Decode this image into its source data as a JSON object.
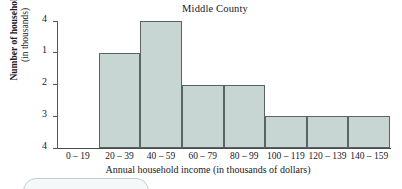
{
  "chart_data": {
    "type": "bar",
    "title": "Middle County",
    "xlabel": "Annual household income (in thousands of dollars)",
    "ylabel": "Number of households",
    "ylabel_line2": "(in thousands)",
    "categories": [
      "0 – 19",
      "20 – 39",
      "40 – 59",
      "60 – 79",
      "80 – 99",
      "100 – 119",
      "120 – 139",
      "140 – 159"
    ],
    "values": [
      0,
      3,
      4,
      2,
      2,
      1,
      1,
      1
    ],
    "ylim": [
      0,
      4
    ],
    "yticks": [
      1,
      2,
      3,
      4
    ],
    "ytick_labels": [
      "1",
      "2",
      "3",
      "4"
    ],
    "grid": false,
    "legend": null,
    "bar_fill_color": "#c7d5d3",
    "bar_border_color": "#5a6463",
    "axis_color": "#4a4a4a"
  }
}
